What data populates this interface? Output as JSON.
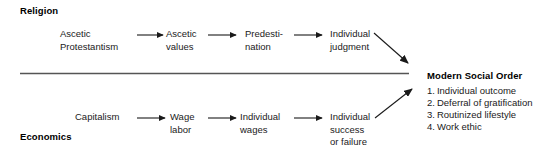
{
  "figure": {
    "type": "flow-diagram",
    "background_color": "#ffffff",
    "line_color": "#1a1a1a",
    "divider_color": "#555555"
  },
  "rows": {
    "religion": {
      "label": "Religion",
      "nodes": [
        {
          "id": "ascetic-protestantism",
          "line1": "Ascetic",
          "line2": "Protestantism"
        },
        {
          "id": "ascetic-values",
          "line1": "Ascetic",
          "line2": "values"
        },
        {
          "id": "predestination",
          "line1": "Predesti-",
          "line2": "nation"
        },
        {
          "id": "individual-judgment",
          "line1": "Individual",
          "line2": "judgment"
        }
      ]
    },
    "economics": {
      "label": "Economics",
      "nodes": [
        {
          "id": "capitalism",
          "line1": "Capitalism",
          "line2": ""
        },
        {
          "id": "wage-labor",
          "line1": "Wage",
          "line2": "labor"
        },
        {
          "id": "individual-wages",
          "line1": "Individual",
          "line2": "wages"
        },
        {
          "id": "individual-success-or-failure",
          "line1": "Individual",
          "line2": "success",
          "line3": "or failure"
        }
      ]
    }
  },
  "outcome": {
    "title": "Modern Social Order",
    "items": [
      {
        "num": "1.",
        "text": "Individual outcome"
      },
      {
        "num": "2.",
        "text": "Deferral of gratification"
      },
      {
        "num": "3.",
        "text": "Routinized lifestyle"
      },
      {
        "num": "4.",
        "text": "Work ethic"
      }
    ]
  }
}
